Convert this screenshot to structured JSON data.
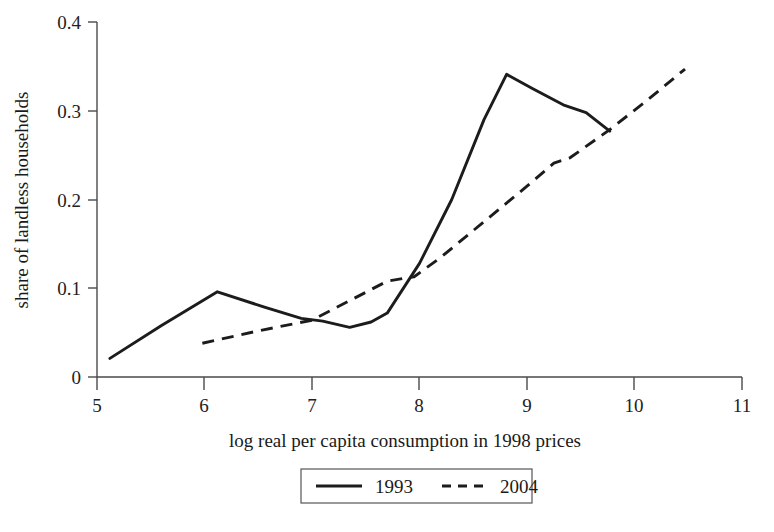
{
  "chart_data": {
    "type": "line",
    "title": "",
    "xlabel": "log real per capita consumption in 1998 prices",
    "ylabel": "share of landless households",
    "xlim": [
      5,
      11
    ],
    "ylim": [
      0,
      0.4
    ],
    "xticks": [
      "5",
      "6",
      "7",
      "8",
      "9",
      "10",
      "11"
    ],
    "xtick_values": [
      5,
      6,
      7,
      8,
      9,
      10,
      11
    ],
    "yticks": [
      "0",
      "0.1",
      "0.2",
      "0.3",
      "0.4"
    ],
    "ytick_values": [
      0,
      0.1,
      0.2,
      0.3,
      0.4
    ],
    "grid": false,
    "legend_position": "below-axes-center",
    "series": [
      {
        "name": "1993",
        "style": "solid",
        "color": "#1c1c1c",
        "x": [
          5.12,
          5.6,
          6.12,
          6.55,
          6.9,
          7.1,
          7.35,
          7.55,
          7.7,
          8.0,
          8.3,
          8.6,
          8.81,
          9.05,
          9.35,
          9.55,
          9.77
        ],
        "y": [
          0.021,
          0.058,
          0.096,
          0.079,
          0.066,
          0.063,
          0.056,
          0.062,
          0.072,
          0.128,
          0.2,
          0.29,
          0.341,
          0.325,
          0.306,
          0.298,
          0.277
        ]
      },
      {
        "name": "2004",
        "style": "dashed",
        "color": "#1c1c1c",
        "x": [
          5.98,
          6.5,
          7.0,
          7.35,
          7.7,
          7.95,
          8.2,
          8.6,
          9.0,
          9.25,
          9.4,
          9.75,
          10.1,
          10.47
        ],
        "y": [
          0.038,
          0.052,
          0.064,
          0.086,
          0.108,
          0.113,
          0.135,
          0.175,
          0.215,
          0.241,
          0.247,
          0.277,
          0.31,
          0.347
        ]
      }
    ]
  },
  "axes": {
    "y_axis_label": "share of landless households",
    "x_axis_label": "log real per capita consumption in 1998 prices",
    "y_tick_labels": [
      "0.4",
      "0.3",
      "0.2",
      "0.1",
      "0"
    ],
    "x_tick_labels": [
      "5",
      "6",
      "7",
      "8",
      "9",
      "10",
      "11"
    ]
  },
  "legend": {
    "entries": [
      {
        "label": "1993",
        "style": "solid"
      },
      {
        "label": "2004",
        "style": "dashed"
      }
    ]
  }
}
